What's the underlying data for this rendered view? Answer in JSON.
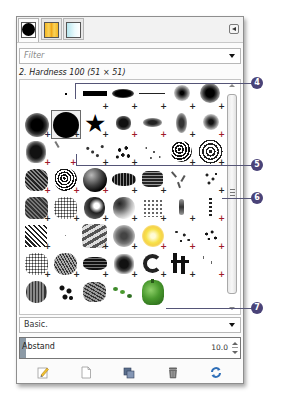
{
  "tabs": [
    {
      "name": "brushes",
      "icon": "brush-swatch-icon",
      "active": true
    },
    {
      "name": "patterns",
      "icon": "pattern-swatch-icon",
      "active": false
    },
    {
      "name": "gradients",
      "icon": "gradient-swatch-icon",
      "active": false
    }
  ],
  "menu_button": {
    "icon": "tab-menu-icon"
  },
  "filter": {
    "placeholder": "Filter",
    "value": ""
  },
  "brush_title": "2. Hardness 100 (51 × 51)",
  "brush_grid": {
    "selected_index": 8,
    "rows": [
      [
        "pixel-dot",
        "bar-hard",
        "ellipse",
        "thin-line",
        "fuzzy-small",
        "fuzzy-large",
        "blank"
      ],
      [
        "fuzzy-round",
        "hardness-100",
        "star",
        "splatter-1",
        "splatter-2",
        "splatter-3",
        "soft-blob"
      ],
      [
        "grunge-square",
        "scratch",
        "dots-scatter",
        "dots-mix",
        "dots-fine",
        "cells",
        "cells-large"
      ],
      [
        "grunge-1",
        "grunge-2",
        "dark-sphere",
        "texture-oval",
        "texture-rect",
        "leaves",
        "sparkle"
      ],
      [
        "grunge-3",
        "noise",
        "acrylic",
        "smoke",
        "chalk",
        "streak",
        "drip"
      ],
      [
        "diagonal-lines",
        "blank-2",
        "zebra",
        "smoke-2",
        "sun",
        "spatter-1",
        "spatter-2"
      ],
      [
        "speckle",
        "hair",
        "ink-1",
        "ink-2",
        "ink-3",
        "ink-4",
        "fine-spray"
      ],
      [
        "sponge",
        "splatter-4",
        "sponge-2",
        "vine",
        "pepper"
      ]
    ]
  },
  "tag_combo": {
    "value": "Basic."
  },
  "spacing": {
    "label": "Abstand",
    "value": "10.0"
  },
  "actions": [
    {
      "name": "edit-brush",
      "icon": "edit-icon"
    },
    {
      "name": "new-brush",
      "icon": "new-document-icon"
    },
    {
      "name": "duplicate-brush",
      "icon": "duplicate-icon"
    },
    {
      "name": "delete-brush",
      "icon": "trash-icon"
    },
    {
      "name": "refresh-brushes",
      "icon": "refresh-icon"
    }
  ],
  "callouts": [
    "4",
    "5",
    "6",
    "7"
  ],
  "colors": {
    "callout": "#4a4378",
    "pepper": "#4a9a2e",
    "sun": "#f7e24a"
  }
}
